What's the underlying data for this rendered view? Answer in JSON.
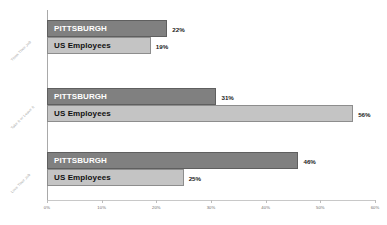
{
  "chart_data": {
    "type": "bar",
    "orientation": "horizontal",
    "title": "",
    "xlabel": "",
    "ylabel": "",
    "xlim": [
      0,
      60
    ],
    "grid": false,
    "legend": false,
    "categories": [
      "Think Their Job",
      "Take It or Leave It",
      "Love Their Job"
    ],
    "tick_labels": [
      "0%",
      "10%",
      "20%",
      "30%",
      "40%",
      "50%",
      "60%"
    ],
    "tick_values": [
      0,
      10,
      20,
      30,
      40,
      50,
      60
    ],
    "series": [
      {
        "name": "PITTSBURGH",
        "color": "#808080",
        "text_color": "#ffffff",
        "values": [
          22,
          31,
          46
        ],
        "value_labels": [
          "22%",
          "31%",
          "46%"
        ]
      },
      {
        "name": "US Employees",
        "color": "#c4c4c4",
        "text_color": "#111111",
        "values": [
          19,
          56,
          25
        ],
        "value_labels": [
          "19%",
          "56%",
          "25%"
        ]
      }
    ]
  }
}
